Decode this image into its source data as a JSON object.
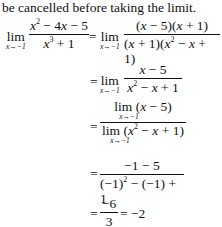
{
  "intro": "be cancelled before taking the limit.",
  "lines": [
    {
      "lim": "lim",
      "sub": "x→−1",
      "num": "x² − 4x − 5",
      "den": "x³ + 1"
    },
    {
      "lim": "lim",
      "sub": "x→−1",
      "num": "(x − 5)(x + 1)",
      "den": "(x + 1)(x² − x + 1)"
    },
    {
      "lim": "lim",
      "sub": "x→−1",
      "num": "x − 5",
      "den": "x² − x + 1"
    },
    {
      "num": "lim (x − 5)",
      "den": "lim (x² − x + 1)",
      "sub": "x→−1"
    },
    {
      "num": "−1 − 5",
      "den": "(−1)² − (−1) + 1"
    },
    {
      "num": "−6",
      "den": "3",
      "result": "= −2"
    }
  ],
  "equals": "="
}
